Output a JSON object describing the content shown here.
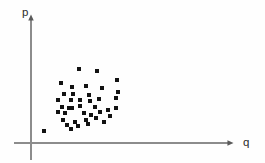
{
  "figure": {
    "title": "",
    "background_color": "#fefefe"
  },
  "axes": {
    "x_axis": {
      "label": "q",
      "name": "x-axis",
      "color": "#8c8c8c",
      "arrow": "arrowhead-right",
      "label_x": 246,
      "label_y": 142,
      "y_position": 143,
      "x_start": 14,
      "x_end": 228
    },
    "y_axis": {
      "label": "p",
      "name": "y-axis",
      "color": "#8c8c8c",
      "arrow": "arrowhead-up",
      "label_x": 25,
      "label_y": 15,
      "x_position": 31,
      "y_start": 20,
      "y_end": 160
    }
  },
  "chart_data": {
    "type": "scatter",
    "title": "",
    "xlabel": "q",
    "ylabel": "p",
    "grid": false,
    "legend": null,
    "marker": {
      "shape": "square",
      "size_px": 3.2,
      "color": "#121212"
    },
    "xlim": [
      31,
      228
    ],
    "ylim": [
      143,
      20
    ],
    "note": "Pixel coordinates of markers in the original 265x163 image; origin of plot axes at (31,143).",
    "points_px": [
      [
        79,
        69
      ],
      [
        97,
        71
      ],
      [
        117,
        80
      ],
      [
        61,
        83
      ],
      [
        72,
        87
      ],
      [
        86,
        86
      ],
      [
        102,
        88
      ],
      [
        118,
        92
      ],
      [
        64,
        94
      ],
      [
        73,
        94
      ],
      [
        89,
        95
      ],
      [
        116,
        98
      ],
      [
        58,
        100
      ],
      [
        71,
        100
      ],
      [
        80,
        100
      ],
      [
        90,
        101
      ],
      [
        99,
        99
      ],
      [
        62,
        107
      ],
      [
        69,
        108
      ],
      [
        72,
        108
      ],
      [
        80,
        106
      ],
      [
        95,
        107
      ],
      [
        108,
        110
      ],
      [
        116,
        108
      ],
      [
        58,
        112
      ],
      [
        65,
        113
      ],
      [
        84,
        113
      ],
      [
        91,
        115
      ],
      [
        100,
        112
      ],
      [
        63,
        120
      ],
      [
        75,
        122
      ],
      [
        86,
        120
      ],
      [
        96,
        118
      ],
      [
        67,
        125
      ],
      [
        78,
        126
      ],
      [
        44,
        131
      ],
      [
        71,
        129
      ],
      [
        88,
        124
      ],
      [
        104,
        122
      ],
      [
        110,
        116
      ]
    ],
    "x": [
      79,
      97,
      117,
      61,
      72,
      86,
      102,
      118,
      64,
      73,
      89,
      116,
      58,
      71,
      80,
      90,
      99,
      62,
      69,
      72,
      80,
      95,
      108,
      116,
      58,
      65,
      84,
      91,
      100,
      63,
      75,
      86,
      96,
      67,
      78,
      44,
      71,
      88,
      104,
      110
    ],
    "y": [
      69,
      71,
      80,
      83,
      87,
      86,
      88,
      92,
      94,
      94,
      95,
      98,
      100,
      100,
      100,
      101,
      99,
      107,
      108,
      108,
      106,
      107,
      110,
      108,
      112,
      113,
      113,
      115,
      112,
      120,
      122,
      120,
      118,
      125,
      126,
      131,
      129,
      124,
      122,
      116
    ],
    "n_points": 40
  }
}
